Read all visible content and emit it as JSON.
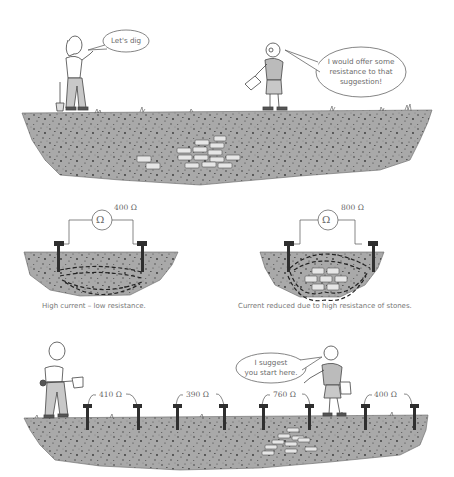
{
  "panel_top": {
    "woman_speech": "Let's dig",
    "man_speech": [
      "I would offer some",
      "resistance to that",
      "suggestion!"
    ]
  },
  "panel_middle": {
    "left": {
      "meter_symbol": "Ω",
      "reading": "400 Ω",
      "caption": "High current – low resistance."
    },
    "right": {
      "meter_symbol": "Ω",
      "reading": "800 Ω",
      "caption": "Current reduced due to high resistance of stones."
    }
  },
  "panel_bottom": {
    "man_speech": [
      "I suggest",
      "you start here."
    ],
    "readings": [
      "410 Ω",
      "390 Ω",
      "760 Ω",
      "400 Ω"
    ]
  },
  "colors": {
    "soil": "#a9a9a9",
    "soil_speck": "#3a3a3a",
    "stone": "#e6e6e6",
    "probe": "#2f2f2f",
    "line": "#555555"
  }
}
